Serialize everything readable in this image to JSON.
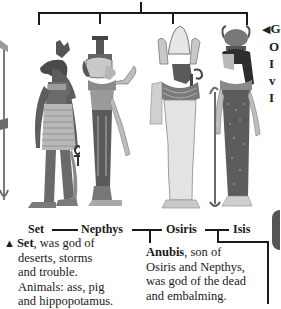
{
  "diagram": {
    "type": "family-tree-illustration",
    "figures": [
      {
        "name": "Set",
        "description": "jackal-like animal head, tall crown, holding ankh"
      },
      {
        "name": "Nepthys",
        "description": "woman with house-shaped headdress, raised hand"
      },
      {
        "name": "Osiris",
        "description": "white atef crown, crook and flail, mummy wrappings"
      },
      {
        "name": "Isis",
        "description": "horned sun-disc crown, dotted dress, holding staff"
      }
    ],
    "labels": {
      "set": "Set",
      "nepthys": "Nepthys",
      "osiris": "Osiris",
      "isis": "Isis"
    },
    "captions": {
      "set": {
        "marker": "▲",
        "name": "Set",
        "lines": [
          ", was god of",
          "deserts, storms",
          "and trouble.",
          "Animals: ass, pig",
          "and hippopotamus."
        ]
      },
      "anubis": {
        "name": "Anubis",
        "lines": [
          ", son of",
          "Osiris and Nepthys,",
          "was god of the dead",
          "and embalming."
        ]
      },
      "right_cutoff": {
        "marker": "◀",
        "visible_chars": [
          "G",
          "O",
          "I",
          "v",
          "I",
          "\"",
          "v",
          "c"
        ]
      }
    },
    "colors": {
      "line": "#1a1a1a",
      "figure_dark": "#5a5a5a",
      "figure_mid": "#8e8e8e",
      "figure_light": "#d6d6d6",
      "background": "#ffffff"
    }
  }
}
